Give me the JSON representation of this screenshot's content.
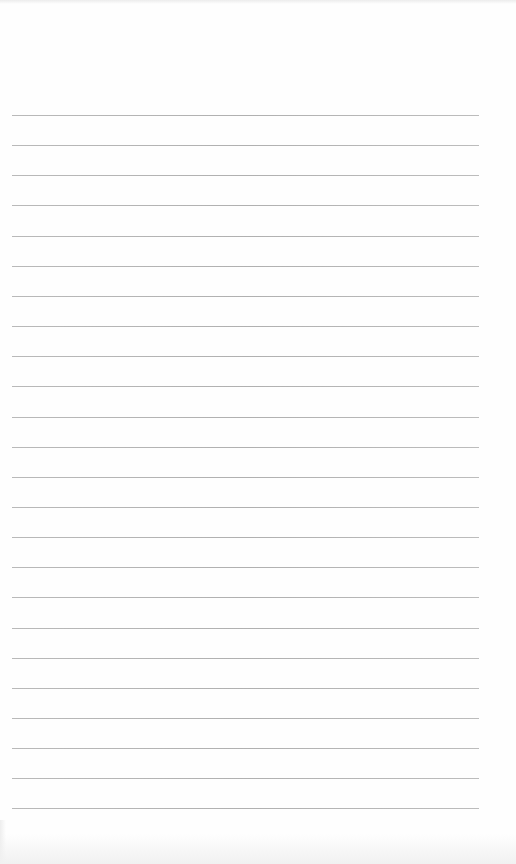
{
  "paper": {
    "background": "#fefefe",
    "line_color": "#b5b5b5",
    "line_count": 24,
    "first_line_y": 115,
    "line_spacing": 30.15,
    "line_left": 12,
    "line_right": 479
  }
}
